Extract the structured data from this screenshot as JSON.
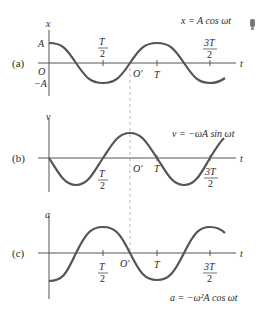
{
  "figure": {
    "panels": [
      {
        "id": "a",
        "panel_label": "(a)",
        "y_axis_label": "x",
        "t_label": "t",
        "equation": "x = A cos ωt",
        "amp_top_label": "A",
        "amp_bottom_label": "−A",
        "origin_label": "O",
        "origin_prime_label": "O′",
        "ticks": {
          "half_num": "T",
          "half_den": "2",
          "full": "T",
          "three_half_num": "3T",
          "three_half_den": "2"
        }
      },
      {
        "id": "b",
        "panel_label": "(b)",
        "y_axis_label": "v",
        "t_label": "t",
        "equation": "v = −ωA sin ωt",
        "origin_prime_label": "O′",
        "ticks": {
          "half_num": "T",
          "half_den": "2",
          "full": "T",
          "three_half_num": "3T",
          "three_half_den": "2"
        }
      },
      {
        "id": "c",
        "panel_label": "(c)",
        "y_axis_label": "a",
        "t_label": "t",
        "equation": "a = −ω²A cos ωt",
        "origin_prime_label": "O′",
        "ticks": {
          "half_num": "T",
          "half_den": "2",
          "full": "T",
          "three_half_num": "3T",
          "three_half_den": "2"
        }
      }
    ],
    "colors": {
      "curve": "#555555",
      "axis": "#555555",
      "dashed": "#aaaaaa",
      "text": "#2a2a2a"
    }
  }
}
